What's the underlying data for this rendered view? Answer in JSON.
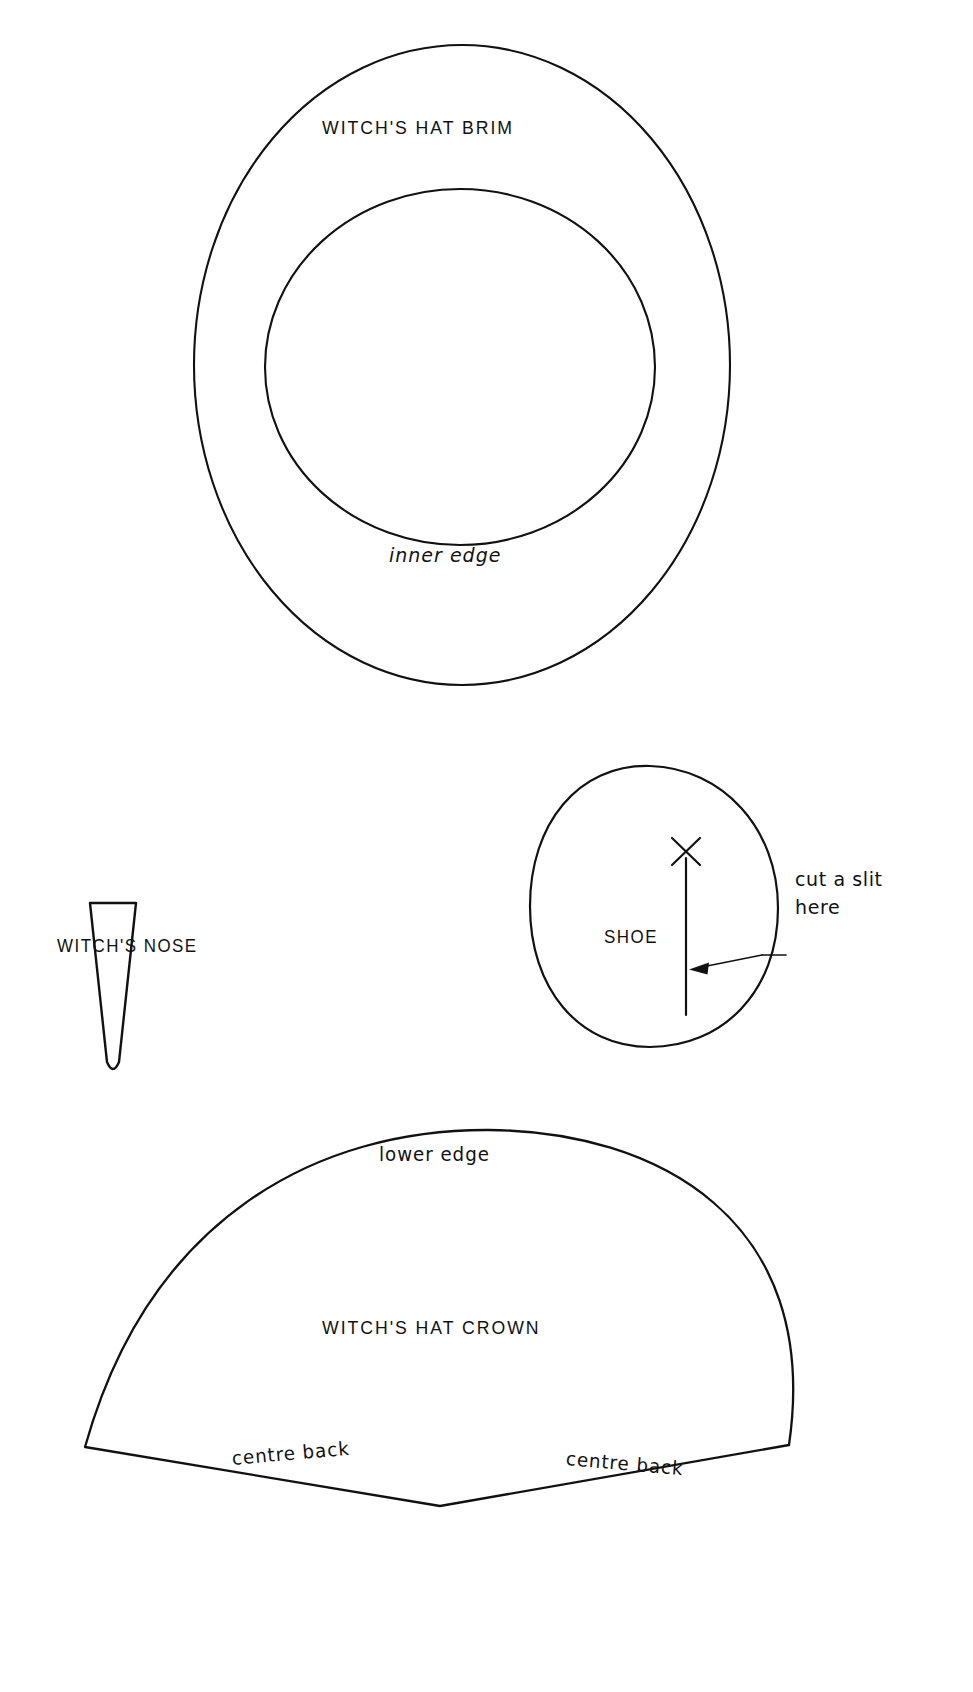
{
  "document": {
    "title": "Witch's Costume Cutting Pattern",
    "background_color": "#ffffff",
    "line_color": "#111111",
    "width": 973,
    "height": 1692
  },
  "pieces": {
    "brim": {
      "label": "WITCH'S HAT BRIM",
      "inner_edge_label": "inner edge"
    },
    "nose": {
      "label": "WITCH'S NOSE"
    },
    "shoe": {
      "label": "SHOE",
      "annotation_line1": "cut a slit",
      "annotation_line2": "here",
      "mark": "X"
    },
    "crown": {
      "label": "WITCH'S HAT CROWN",
      "lower_edge_label": "lower edge",
      "centre_back_left": "centre back",
      "centre_back_right": "centre back"
    }
  }
}
